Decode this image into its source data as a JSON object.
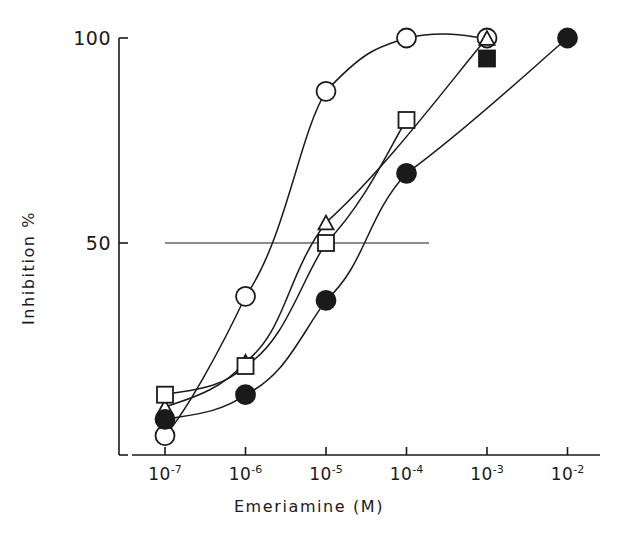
{
  "chart_data": {
    "type": "line",
    "title": "",
    "xlabel": "Emeriamine (M)",
    "ylabel": "Inhibition %",
    "xscale": "log",
    "xlim": [
      -7.5,
      -1.7
    ],
    "ylim": [
      0,
      104
    ],
    "grid": false,
    "legend_position": "none",
    "xtick_labels": [
      "10-7",
      "10-6",
      "10-5",
      "10-4",
      "10-3",
      "10-2"
    ],
    "xtick_mantissas": [
      "10",
      "10",
      "10",
      "10",
      "10",
      "10"
    ],
    "xtick_exponents": [
      "-7",
      "-6",
      "-5",
      "-4",
      "-3",
      "-2"
    ],
    "xtick_values": [
      -7,
      -6,
      -5,
      -4,
      -3,
      -2
    ],
    "ytick_labels": [
      "50",
      "100"
    ],
    "ytick_values": [
      50,
      100
    ],
    "reference_line": {
      "y": 50,
      "x_start": -7.0,
      "x_end": -3.72
    },
    "series": [
      {
        "name": "open-circle",
        "marker": "open-circle",
        "x": [
          -7,
          -6,
          -5,
          -4,
          -3
        ],
        "values": [
          3,
          37,
          87,
          100,
          100
        ]
      },
      {
        "name": "open-triangle",
        "marker": "open-triangle",
        "x": [
          -7,
          -6,
          -5,
          -3
        ],
        "values": [
          10,
          21,
          55,
          100
        ]
      },
      {
        "name": "open-square",
        "marker": "open-square",
        "x": [
          -7,
          -6,
          -5,
          -4
        ],
        "values": [
          13,
          20,
          50,
          80
        ]
      },
      {
        "name": "filled-circle",
        "marker": "filled-circle",
        "x": [
          -7,
          -6,
          -5,
          -4,
          -2
        ],
        "values": [
          7,
          13,
          36,
          67,
          100
        ]
      },
      {
        "name": "filled-square",
        "marker": "filled-square",
        "x": [
          -3
        ],
        "values": [
          95
        ]
      }
    ]
  },
  "colors": {
    "ink": "#1a1a1a",
    "background": "#ffffff"
  }
}
